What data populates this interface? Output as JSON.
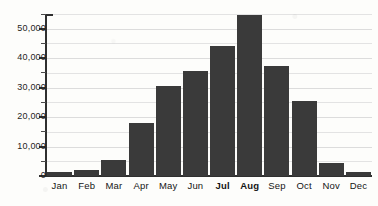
{
  "chart_data": {
    "type": "bar",
    "title": "",
    "xlabel": "",
    "ylabel": "",
    "categories": [
      "Jan",
      "Feb",
      "Mar",
      "Apr",
      "May",
      "Jun",
      "Jul",
      "Aug",
      "Sep",
      "Oct",
      "Nov",
      "Dec"
    ],
    "values": [
      1500,
      2000,
      5500,
      18000,
      30500,
      35500,
      44000,
      54500,
      37500,
      25500,
      4500,
      1500
    ],
    "series": [
      {
        "name": "Monthly total",
        "values": [
          1500,
          2000,
          5500,
          18000,
          30500,
          35500,
          44000,
          54500,
          37500,
          25500,
          4500,
          1500
        ]
      }
    ],
    "ylim": [
      0,
      55000
    ],
    "y_major_ticks": [
      0,
      10000,
      20000,
      30000,
      40000,
      50000
    ],
    "y_major_tick_labels": [
      "0",
      "10,000",
      "20,000",
      "30,000",
      "40,000",
      "50,000"
    ],
    "y_minor_ticks": [
      5000,
      15000,
      25000,
      35000,
      45000,
      55000
    ],
    "grid": true,
    "grid_axis": "y",
    "legend": false,
    "legend_position": "none",
    "bar_color": "#3a3a3a",
    "grid_color": "#e3e3e3",
    "axis_color": "#2f2f2f",
    "background_color": "#fdfdfb",
    "emphasized_categories": [
      "Jul",
      "Aug"
    ],
    "annotations": []
  }
}
